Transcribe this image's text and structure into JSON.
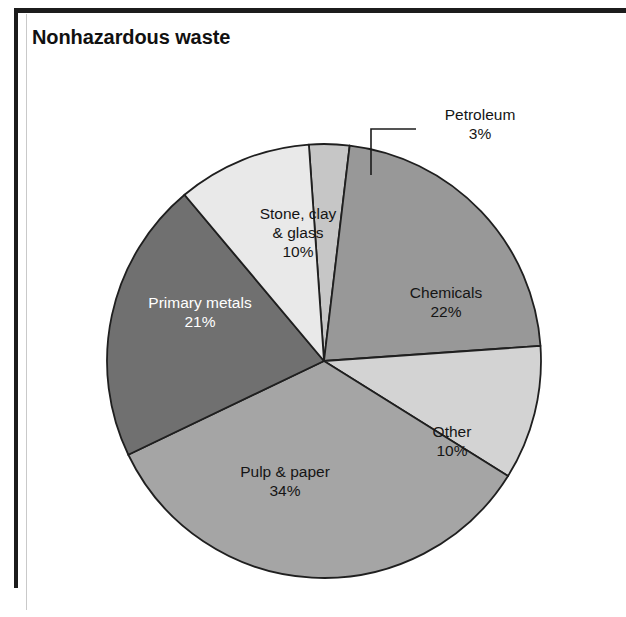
{
  "figure": {
    "title": "Nonhazardous waste",
    "background_color": "#ffffff",
    "rule_color": "#1c1c1c",
    "outline_color": "#1f1f1f"
  },
  "scan_artifacts": {
    "top": "",
    "middle": "",
    "bottom": ""
  },
  "chart_data": {
    "type": "pie",
    "title": "Nonhazardous waste",
    "xlabel": "",
    "ylabel": "",
    "units": "percent",
    "total": 100,
    "start_angle_deg": -94,
    "direction": "clockwise",
    "legend": "none",
    "grid": false,
    "categories": [
      "Petroleum",
      "Chemicals",
      "Other",
      "Pulp & paper",
      "Primary metals",
      "Stone, clay & glass"
    ],
    "values": [
      3,
      22,
      10,
      34,
      21,
      10
    ],
    "slices": [
      {
        "name": "Petroleum",
        "label_lines": [
          "Petroleum",
          "3%"
        ],
        "value": 3,
        "value_label": "3%",
        "color": "#c6c6c6",
        "text_color": "#151515",
        "label_placement": "callout",
        "label_x": 480,
        "label_y": 120,
        "leader": {
          "x1": 371,
          "y1": 175,
          "x2": 371,
          "y2": 129,
          "x3": 416,
          "y3": 129
        }
      },
      {
        "name": "Chemicals",
        "label_lines": [
          "Chemicals",
          "22%"
        ],
        "value": 22,
        "value_label": "22%",
        "color": "#989898",
        "text_color": "#151515",
        "label_placement": "inside",
        "label_x": 446,
        "label_y": 298
      },
      {
        "name": "Other",
        "label_lines": [
          "Other",
          "10%"
        ],
        "value": 10,
        "value_label": "10%",
        "color": "#d3d3d3",
        "text_color": "#151515",
        "label_placement": "inside",
        "label_x": 452,
        "label_y": 437
      },
      {
        "name": "Pulp & paper",
        "label_lines": [
          "Pulp & paper",
          "34%"
        ],
        "value": 34,
        "value_label": "34%",
        "color": "#a5a5a5",
        "text_color": "#151515",
        "label_placement": "inside",
        "label_x": 285,
        "label_y": 477
      },
      {
        "name": "Primary metals",
        "label_lines": [
          "Primary metals",
          "21%"
        ],
        "value": 21,
        "value_label": "21%",
        "color": "#707070",
        "text_color": "#ffffff",
        "label_placement": "inside",
        "label_x": 200,
        "label_y": 308
      },
      {
        "name": "Stone, clay & glass",
        "label_lines": [
          "Stone, clay",
          "& glass",
          "10%"
        ],
        "value": 10,
        "value_label": "10%",
        "color": "#e9e9e9",
        "text_color": "#151515",
        "label_placement": "inside",
        "label_x": 298,
        "label_y": 219
      }
    ],
    "geometry": {
      "center_x": 324,
      "center_y": 361,
      "radius": 217
    }
  }
}
